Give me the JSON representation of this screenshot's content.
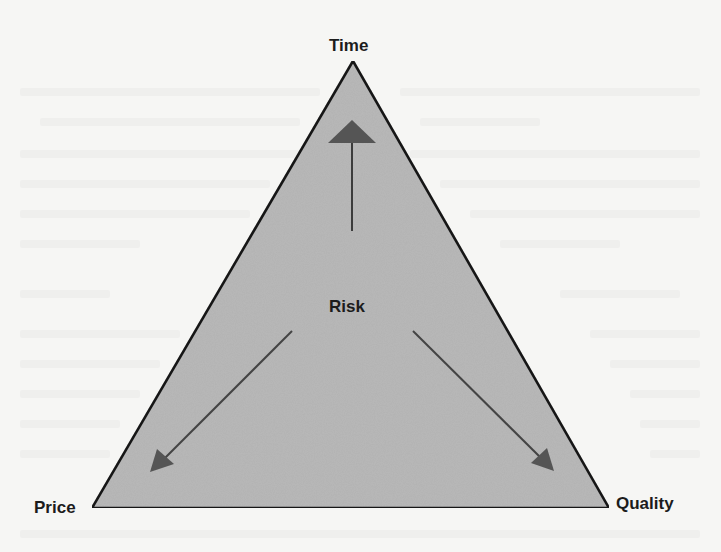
{
  "diagram": {
    "type": "project-triangle",
    "vertices": {
      "top": {
        "label": "Time"
      },
      "bottom_left": {
        "label": "Price"
      },
      "bottom_right": {
        "label": "Quality"
      }
    },
    "center": {
      "label": "Risk"
    },
    "arrows": [
      {
        "from": "Risk",
        "to": "Time"
      },
      {
        "from": "Risk",
        "to": "Price"
      },
      {
        "from": "Risk",
        "to": "Quality"
      }
    ]
  },
  "colors": {
    "paper": "#f6f6f4",
    "triangle_fill": "#b9b9b9",
    "triangle_stroke": "#1e1e1e",
    "arrow": "#4a4a4a",
    "label_text": "#1c1c1c"
  }
}
